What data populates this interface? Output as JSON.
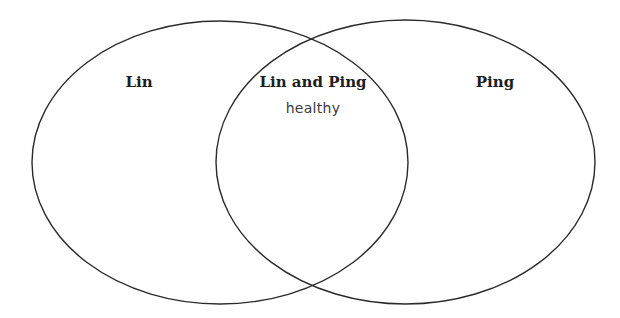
{
  "diagram": {
    "type": "venn",
    "sets": [
      {
        "id": "lin",
        "label": "Lin"
      },
      {
        "id": "ping",
        "label": "Ping"
      }
    ],
    "intersection": {
      "label": "Lin and Ping",
      "items": [
        "healthy"
      ]
    },
    "only_lin_items": [],
    "only_ping_items": [],
    "colors": {
      "outline": "#2b2b2b",
      "text": "#1e1e1e",
      "item_text": "#3a3a3a",
      "background": "#ffffff"
    }
  }
}
